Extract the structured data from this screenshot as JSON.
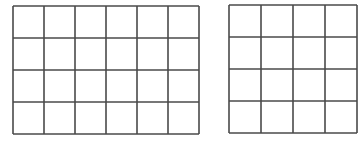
{
  "figure": {
    "line_color": "#4a4a4a",
    "background": "#ffffff",
    "grids": [
      {
        "name": "left-grid",
        "x": 12,
        "y": 5,
        "width": 186,
        "height": 128,
        "cols": 6,
        "rows": 4
      },
      {
        "name": "right-grid",
        "x": 228,
        "y": 4,
        "width": 128,
        "height": 128,
        "cols": 4,
        "rows": 4,
        "clipped_right": true
      }
    ]
  }
}
